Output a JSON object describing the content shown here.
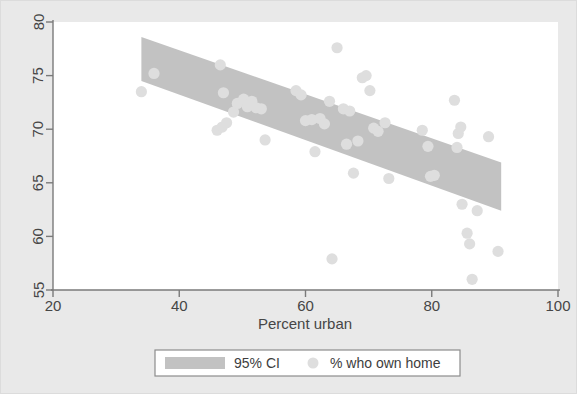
{
  "chart_data": {
    "type": "scatter",
    "title": "",
    "subtitle": "",
    "xlabel": "Percent urban",
    "ylabel": "",
    "xlim": [
      20,
      100
    ],
    "ylim": [
      55,
      80
    ],
    "xticks": [
      20,
      40,
      60,
      80,
      100
    ],
    "yticks": [
      55,
      60,
      65,
      70,
      75,
      80
    ],
    "xtick_labels": [
      "20",
      "40",
      "60",
      "80",
      "100"
    ],
    "ytick_labels": [
      "55",
      "60",
      "65",
      "70",
      "75",
      "80"
    ],
    "grid": false,
    "legend_position": "below-axis",
    "legend": [
      {
        "label": "95% CI",
        "marker": "band",
        "color": "#c2c2c2"
      },
      {
        "label": "% who own home",
        "marker": "circle",
        "color": "#dedede"
      }
    ],
    "series": [
      {
        "name": "% who own home",
        "marker": "circle",
        "color": "#dedede",
        "points": [
          [
            34.0,
            73.5
          ],
          [
            36.0,
            75.2
          ],
          [
            46.5,
            76.0
          ],
          [
            47.0,
            73.4
          ],
          [
            46.0,
            69.9
          ],
          [
            46.8,
            70.2
          ],
          [
            47.5,
            70.6
          ],
          [
            48.6,
            71.6
          ],
          [
            49.2,
            72.4
          ],
          [
            50.2,
            72.8
          ],
          [
            50.8,
            72.1
          ],
          [
            51.5,
            72.6
          ],
          [
            52.2,
            72.0
          ],
          [
            53.0,
            71.9
          ],
          [
            53.6,
            69.0
          ],
          [
            58.5,
            73.6
          ],
          [
            59.3,
            73.2
          ],
          [
            60.0,
            70.8
          ],
          [
            61.0,
            70.9
          ],
          [
            61.5,
            67.9
          ],
          [
            62.3,
            71.0
          ],
          [
            63.0,
            70.5
          ],
          [
            63.8,
            72.6
          ],
          [
            64.2,
            57.9
          ],
          [
            65.0,
            77.6
          ],
          [
            66.0,
            71.9
          ],
          [
            66.5,
            68.6
          ],
          [
            67.0,
            71.7
          ],
          [
            67.6,
            65.9
          ],
          [
            68.3,
            68.9
          ],
          [
            69.0,
            74.8
          ],
          [
            69.6,
            75.0
          ],
          [
            70.2,
            73.6
          ],
          [
            70.8,
            70.1
          ],
          [
            71.5,
            69.8
          ],
          [
            72.6,
            70.6
          ],
          [
            73.2,
            65.4
          ],
          [
            78.5,
            69.9
          ],
          [
            79.4,
            68.4
          ],
          [
            79.8,
            65.6
          ],
          [
            80.4,
            65.7
          ],
          [
            83.6,
            72.7
          ],
          [
            84.0,
            68.3
          ],
          [
            84.2,
            69.6
          ],
          [
            84.6,
            70.2
          ],
          [
            84.8,
            63.0
          ],
          [
            85.6,
            60.3
          ],
          [
            86.0,
            59.3
          ],
          [
            86.4,
            56.0
          ],
          [
            87.2,
            62.4
          ],
          [
            89.0,
            69.3
          ],
          [
            90.5,
            58.6
          ]
        ]
      }
    ],
    "ci_band": {
      "name": "95% CI",
      "color": "#c2c2c2",
      "x": [
        34.0,
        91.0
      ],
      "upper": [
        78.6,
        66.9
      ],
      "lower": [
        74.5,
        62.4
      ]
    }
  },
  "figure": {
    "background_color": "#e9e9e9",
    "plot_background_color": "#ffffff",
    "axis_color": "#7a7a7a",
    "text_color": "#464646"
  }
}
